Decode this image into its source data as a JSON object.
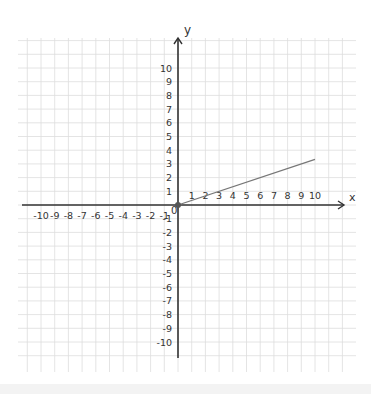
{
  "chart_data": {
    "type": "line",
    "title": "",
    "xlabel": "x",
    "ylabel": "y",
    "xlim": [
      -10,
      10
    ],
    "ylim": [
      -10,
      10
    ],
    "grid": true,
    "x_ticks": [
      -10,
      -9,
      -8,
      -7,
      -6,
      -5,
      -4,
      -3,
      -2,
      -1,
      0,
      1,
      2,
      3,
      4,
      5,
      6,
      7,
      8,
      9,
      10
    ],
    "y_ticks": [
      -10,
      -9,
      -8,
      -7,
      -6,
      -5,
      -4,
      -3,
      -2,
      -1,
      1,
      2,
      3,
      4,
      5,
      6,
      7,
      8,
      9,
      10
    ],
    "origin_label": "0",
    "series": [
      {
        "name": "line",
        "x": [
          0,
          10
        ],
        "y": [
          0,
          3.33
        ],
        "color": "#777777"
      }
    ],
    "points": [
      {
        "x": 0,
        "y": 0,
        "label": "origin"
      }
    ]
  },
  "colors": {
    "axis": "#333333",
    "grid": "#dddddd",
    "line": "#777777",
    "background": "#ffffff"
  }
}
